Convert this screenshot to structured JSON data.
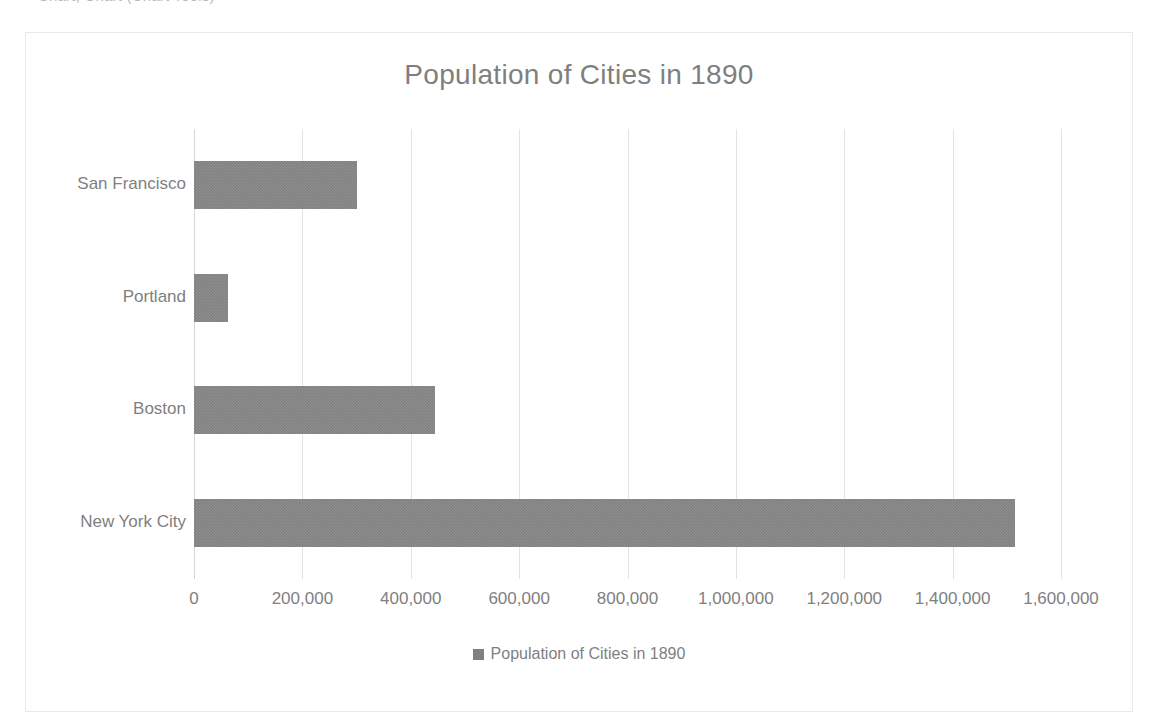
{
  "scan": {
    "top_sliver_text": "Chart;  Chart  (Chart Tools)"
  },
  "chart": {
    "title": "Population of Cities in 1890",
    "legend": {
      "label": "Population of Cities in 1890",
      "swatch_color": "#808080",
      "position": "bottom"
    },
    "colors": {
      "bar": "#808080",
      "text": "#7f7f7f",
      "gridline": "#e3e3e3",
      "border": "#e9e9e9",
      "background": "#ffffff"
    }
  },
  "chart_data": {
    "type": "bar",
    "orientation": "horizontal",
    "title": "Population of Cities in 1890",
    "xlabel": "",
    "ylabel": "",
    "categories": [
      "New York City",
      "Boston",
      "Portland",
      "San Francisco"
    ],
    "values": [
      1515000,
      445000,
      62000,
      300000
    ],
    "series": [
      {
        "name": "Population of Cities in 1890",
        "values": [
          1515000,
          445000,
          62000,
          300000
        ]
      }
    ],
    "xlim": [
      0,
      1600000
    ],
    "xticks": [
      0,
      200000,
      400000,
      600000,
      800000,
      1000000,
      1200000,
      1400000,
      1600000
    ],
    "xtick_labels": [
      "0",
      "200,000",
      "400,000",
      "600,000",
      "800,000",
      "1,000,000",
      "1,200,000",
      "1,400,000",
      "1,600,000"
    ],
    "grid": "vertical",
    "legend_position": "bottom"
  }
}
